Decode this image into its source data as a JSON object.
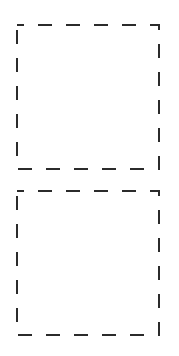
{
  "boxes": [
    {
      "id": "box1",
      "style": "dashed",
      "color": "#2b2b2b",
      "content": ""
    },
    {
      "id": "box2",
      "style": "dashed",
      "color": "#2b2b2b",
      "content": ""
    }
  ]
}
